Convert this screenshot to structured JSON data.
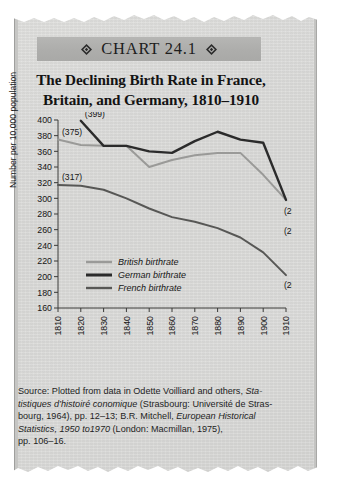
{
  "banner": {
    "label": "CHART 24.1",
    "left_ornament": "diamond-ornament",
    "right_ornament": "diamond-ornament"
  },
  "headline": {
    "line1": "The Declining Birth Rate in France,",
    "line2": "Britain, and Germany, 1810–1910"
  },
  "source": {
    "l1a": "Source: Plotted from data in Odette Voilliard and others, ",
    "l1b": "Sta-",
    "l2a": "tistiques d’histoiré conomique",
    "l2b": " (Strasbourg: Université de Stras-",
    "l3a": "bourg, 1964), pp. 12–13; B.R. Mitchell, ",
    "l3b": "European Historical",
    "l4a": "Statistics, 1950 to1970",
    "l4b": " (London: Macmillan, 1975),",
    "l5": "pp. 106–16."
  },
  "chart_data": {
    "type": "line",
    "title": "The Declining Birth Rate in France, Britain, and Germany, 1810–1910",
    "xlabel": "",
    "ylabel": "Number per 10,000 population",
    "x": [
      1810,
      1820,
      1830,
      1840,
      1850,
      1860,
      1870,
      1880,
      1890,
      1900,
      1910
    ],
    "xlim": [
      1810,
      1910
    ],
    "ylim": [
      160,
      400
    ],
    "ytick_step": 20,
    "yticks": [
      160,
      180,
      200,
      220,
      240,
      260,
      280,
      300,
      320,
      340,
      360,
      380,
      400
    ],
    "xticks": [
      "1810",
      "1820",
      "1830",
      "1840",
      "1850",
      "1860",
      "1870",
      "1880",
      "1890",
      "1900",
      "1910"
    ],
    "grid": false,
    "legend_position": "lower-left-inside",
    "series": [
      {
        "name": "British birthrate",
        "color": "#9a9a98",
        "values": [
          375,
          368,
          367,
          367,
          340,
          349,
          355,
          358,
          358,
          330,
          298
        ]
      },
      {
        "name": "German birthrate",
        "color": "#2b2b2b",
        "values": [
          null,
          399,
          367,
          367,
          360,
          358,
          373,
          385,
          375,
          371,
          298
        ]
      },
      {
        "name": "French birthrate",
        "color": "#575755",
        "values": [
          317,
          316,
          311,
          300,
          287,
          276,
          270,
          262,
          250,
          231,
          202
        ]
      }
    ],
    "annotations": [
      {
        "label": "(375)",
        "series": "British birthrate",
        "x": 1810,
        "y": 375
      },
      {
        "label": "(399)",
        "series": "German birthrate",
        "x": 1820,
        "y": 399
      },
      {
        "label": "(317)",
        "series": "French birthrate",
        "x": 1810,
        "y": 317
      },
      {
        "label": "(298)",
        "series": "German birthrate",
        "x": 1910,
        "y": 298
      },
      {
        "label": "(272)",
        "series": "British birthrate",
        "x": 1910,
        "y": 272
      },
      {
        "label": "(202)",
        "series": "French birthrate",
        "x": 1910,
        "y": 202
      }
    ]
  }
}
